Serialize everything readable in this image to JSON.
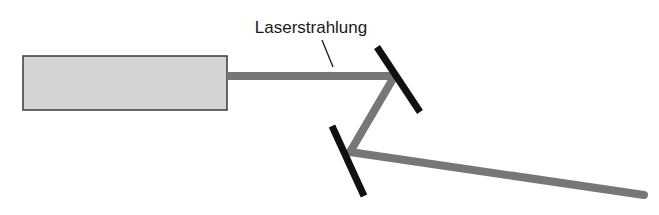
{
  "diagram": {
    "label": "Laserstrahlung",
    "colors": {
      "background": "#ffffff",
      "laser_fill": "#d4d4d4",
      "laser_border": "#3a3a3a",
      "beam": "#777777",
      "mirror": "#111111",
      "text": "#1a1a1a"
    },
    "laser_source": {
      "x": 23,
      "y": 56,
      "width": 204,
      "height": 54
    },
    "beam_segments": [
      {
        "from": [
          227,
          76
        ],
        "to": [
          393,
          76
        ]
      },
      {
        "from": [
          393,
          79
        ],
        "to": [
          350,
          152
        ]
      },
      {
        "from": [
          350,
          152
        ],
        "to": [
          645,
          195
        ]
      }
    ],
    "mirrors": [
      {
        "from": [
          377,
          47
        ],
        "to": [
          420,
          112
        ]
      },
      {
        "from": [
          332,
          126
        ],
        "to": [
          364,
          196
        ]
      }
    ],
    "leader_line": {
      "from": [
        322,
        40
      ],
      "to": [
        333,
        67
      ]
    }
  }
}
